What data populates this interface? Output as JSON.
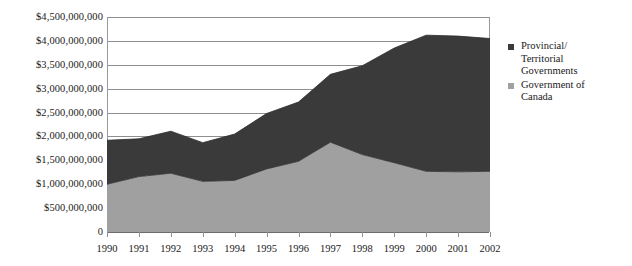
{
  "chart_data": {
    "type": "area",
    "stacked": true,
    "title": "",
    "subtitle": "",
    "xlabel": "",
    "ylabel": "",
    "categories": [
      "1990",
      "1991",
      "1992",
      "1993",
      "1994",
      "1995",
      "1996",
      "1997",
      "1998",
      "1999",
      "2000",
      "2001",
      "2002"
    ],
    "series": [
      {
        "name": "Government of Canada",
        "color": "#a0a0a0",
        "stack_order": 1,
        "values": [
          1000000000,
          1160000000,
          1230000000,
          1060000000,
          1080000000,
          1320000000,
          1480000000,
          1880000000,
          1620000000,
          1450000000,
          1270000000,
          1260000000,
          1270000000
        ]
      },
      {
        "name": "Provincial/ Territorial Governments",
        "color": "#3a3a3a",
        "stack_order": 2,
        "values": [
          920000000,
          790000000,
          880000000,
          810000000,
          970000000,
          1160000000,
          1240000000,
          1420000000,
          1860000000,
          2400000000,
          2850000000,
          2840000000,
          2780000000
        ]
      }
    ],
    "totals": [
      1920000000,
      1950000000,
      2110000000,
      1870000000,
      2050000000,
      2480000000,
      2720000000,
      3300000000,
      3480000000,
      3850000000,
      4120000000,
      4100000000,
      4050000000
    ],
    "ylim": [
      0,
      4500000000
    ],
    "ytick_step": 500000000,
    "ytick_labels": [
      "$4,500,000,000",
      "$4,000,000,000",
      "$3,500,000,000",
      "$3,000,000,000",
      "$2,500,000,000",
      "$2,000,000,000",
      "$1,500,000,000",
      "$1,000,000,000",
      "$500,000,000",
      "0"
    ],
    "ytick_values": [
      4500000000,
      4000000000,
      3500000000,
      3000000000,
      2500000000,
      2000000000,
      1500000000,
      1000000000,
      500000000,
      0
    ],
    "grid": true,
    "grid_axis": "y",
    "legend_position": "right",
    "legend": [
      {
        "label_line1": "Provincial/",
        "label_line2": "Territorial",
        "label_line3": "Governments",
        "color": "#3a3a3a",
        "marker": "square-marker"
      },
      {
        "label_line1": "Government of",
        "label_line2": "Canada",
        "label_line3": "",
        "color": "#a0a0a0",
        "marker": "square-marker"
      }
    ]
  },
  "colors": {
    "provincial_territorial": "#3a3a3a",
    "government_of_canada": "#a0a0a0",
    "gridline": "#8e8e8e",
    "axis": "#9a9a9a",
    "text": "#1a1a1a",
    "background": "#ffffff"
  }
}
